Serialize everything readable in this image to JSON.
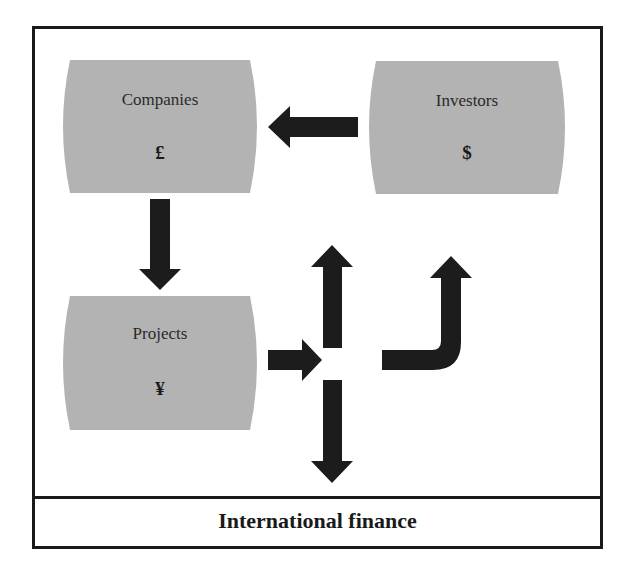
{
  "diagram": {
    "caption": "International finance",
    "nodes": [
      {
        "id": "companies",
        "label": "Companies",
        "symbol": "£"
      },
      {
        "id": "investors",
        "label": "Investors",
        "symbol": "$"
      },
      {
        "id": "projects",
        "label": "Projects",
        "symbol": "¥"
      }
    ],
    "edges": [
      {
        "from": "investors",
        "to": "companies",
        "direction": "left"
      },
      {
        "from": "companies",
        "to": "projects",
        "direction": "down"
      },
      {
        "from": "projects",
        "to": "junction",
        "direction": "right"
      },
      {
        "from": "junction",
        "to": "up",
        "direction": "up"
      },
      {
        "from": "junction",
        "to": "down",
        "direction": "down"
      },
      {
        "from": "junction",
        "to": "investors",
        "direction": "right-then-up"
      }
    ],
    "colors": {
      "node_fill": "#b3b3b3",
      "arrow": "#1c1c1c",
      "frame": "#1a1a1a"
    }
  }
}
